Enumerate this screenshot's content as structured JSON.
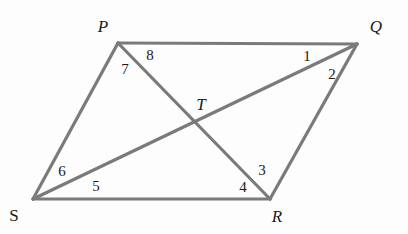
{
  "figure": {
    "width": 408,
    "height": 234,
    "background_color": "#fdfdfd",
    "stroke_color": "#7a7a7a",
    "stroke_width": 3.2,
    "text_color": "#1a1a1a"
  },
  "vertices": [
    {
      "id": "P",
      "label": "P",
      "style": "italic",
      "point_x": 118,
      "point_y": 43,
      "label_x": 103,
      "label_y": 26
    },
    {
      "id": "Q",
      "label": "Q",
      "style": "italic",
      "point_x": 357,
      "point_y": 44,
      "label_x": 376,
      "label_y": 26
    },
    {
      "id": "R",
      "label": "R",
      "style": "italic",
      "point_x": 270,
      "point_y": 199,
      "label_x": 277,
      "label_y": 216
    },
    {
      "id": "S",
      "label": "S",
      "style": "upright",
      "point_x": 33,
      "point_y": 199,
      "label_x": 14,
      "label_y": 215
    },
    {
      "id": "T",
      "label": "T",
      "style": "italic",
      "point_x": 193,
      "point_y": 121,
      "label_x": 201,
      "label_y": 104
    }
  ],
  "segments": [
    {
      "id": "PQ",
      "name": "side-pq",
      "from": "P",
      "to": "Q"
    },
    {
      "id": "QR",
      "name": "side-qr",
      "from": "Q",
      "to": "R"
    },
    {
      "id": "RS",
      "name": "side-rs",
      "from": "R",
      "to": "S"
    },
    {
      "id": "SP",
      "name": "side-sp",
      "from": "S",
      "to": "P"
    },
    {
      "id": "PR",
      "name": "diagonal-pr",
      "from": "P",
      "to": "R"
    },
    {
      "id": "QS",
      "name": "diagonal-qs",
      "from": "Q",
      "to": "S"
    }
  ],
  "angle_labels": [
    {
      "id": "a1",
      "label": "1",
      "x": 307,
      "y": 56,
      "at_vertex": "Q",
      "between": "QP and QS"
    },
    {
      "id": "a2",
      "label": "2",
      "x": 332,
      "y": 74,
      "at_vertex": "Q",
      "between": "QS and QR"
    },
    {
      "id": "a3",
      "label": "3",
      "x": 262,
      "y": 170,
      "at_vertex": "R",
      "between": "RP and RQ"
    },
    {
      "id": "a4",
      "label": "4",
      "x": 243,
      "y": 187,
      "at_vertex": "R",
      "between": "RS and RP"
    },
    {
      "id": "a5",
      "label": "5",
      "x": 96,
      "y": 186,
      "at_vertex": "S",
      "between": "SR and SQ"
    },
    {
      "id": "a6",
      "label": "6",
      "x": 62,
      "y": 171,
      "at_vertex": "S",
      "between": "SQ and SP"
    },
    {
      "id": "a7",
      "label": "7",
      "x": 125,
      "y": 69,
      "at_vertex": "P",
      "between": "PS and PR"
    },
    {
      "id": "a8",
      "label": "8",
      "x": 150,
      "y": 55,
      "at_vertex": "P",
      "between": "PR and PQ"
    }
  ]
}
